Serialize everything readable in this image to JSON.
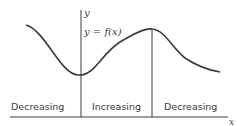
{
  "diagram": {
    "axis_labels": {
      "x": "x",
      "y": "y"
    },
    "curve_label": "y = f(x)",
    "regions": [
      {
        "label": "Decreasing"
      },
      {
        "label": "Increasing"
      },
      {
        "label": "Decreasing"
      }
    ],
    "colors": {
      "line": "#3a3a3a",
      "background": "#ffffff"
    }
  }
}
